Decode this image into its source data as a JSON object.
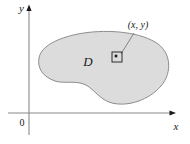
{
  "figure": {
    "type": "math-region-diagram",
    "caption_present": false,
    "background_color": "#ffffff"
  },
  "axes": {
    "x_label": "x",
    "y_label": "y",
    "origin_label": "0",
    "axis_color": "#6e6e6e",
    "arrowhead_color": "#1a1a1a",
    "x_axis": {
      "x_start": 8,
      "x_end": 172,
      "y": 113
    },
    "y_axis": {
      "y_start": 8,
      "y_end": 135,
      "x": 29
    }
  },
  "region": {
    "label": "D",
    "fill_color": "#dcdcdc",
    "stroke_color": "#8c8c8c",
    "label_x": 88,
    "label_y": 62
  },
  "point": {
    "label": "(x, y)",
    "label_x": 138,
    "label_y": 28,
    "marker_shape": "square-with-dot",
    "marker_x": 117,
    "marker_y": 57,
    "marker_size": 10,
    "leader_line_color": "#7a7a7a",
    "marker_stroke_color": "#1a1a1a",
    "dot_color": "#1a1a1a"
  }
}
